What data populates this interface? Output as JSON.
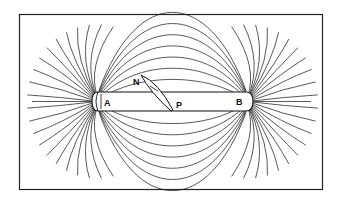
{
  "figure": {
    "labels": {
      "pole_left": "A",
      "pole_right": "B",
      "needle_north": "N",
      "needle_pivot": "P"
    },
    "field_lines": {
      "arches_above": 7,
      "arches_below": 7,
      "radial_lines_per_pole": 22
    },
    "colors": {
      "line": "#111111",
      "background": "#ffffff"
    }
  }
}
